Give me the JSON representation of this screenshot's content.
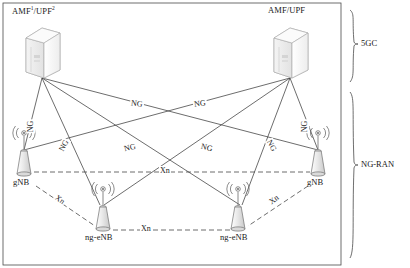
{
  "figure": {
    "type": "network-architecture-diagram",
    "title": "",
    "background": "#ffffff",
    "line_color": "#3c3c3c",
    "node_fill": "#eeeeee"
  },
  "nodes": [
    {
      "id": "amf-upf-left",
      "label": "AMF/UPF",
      "sup1": "1",
      "sup2": "2",
      "has_superscripts": true,
      "icon": "server-box-icon",
      "x": 42,
      "y": 48,
      "label_x": 12,
      "label_y": 6
    },
    {
      "id": "amf-upf-right",
      "label": "AMF/UPF",
      "sup1": "",
      "sup2": "",
      "has_superscripts": false,
      "icon": "server-box-icon",
      "x": 290,
      "y": 48,
      "label_x": 268,
      "label_y": 6
    },
    {
      "id": "gnb-left",
      "label": "gNB",
      "icon": "base-station-icon",
      "x": 24,
      "y": 158,
      "label_x": 13,
      "label_y": 178
    },
    {
      "id": "gnb-right",
      "label": "gNB",
      "icon": "base-station-icon",
      "x": 318,
      "y": 158,
      "label_x": 307,
      "label_y": 178
    },
    {
      "id": "ng-enb-left",
      "label": "ng-eNB",
      "icon": "base-station-icon",
      "x": 103,
      "y": 212,
      "label_x": 84,
      "label_y": 234
    },
    {
      "id": "ng-enb-right",
      "label": "ng-eNB",
      "icon": "base-station-icon",
      "x": 238,
      "y": 212,
      "label_x": 219,
      "label_y": 234
    }
  ],
  "ng_links": [
    {
      "id": "ng-1",
      "from": "amf-upf-left",
      "to": "gnb-left",
      "label": "NG",
      "label_x": 29,
      "label_y": 128,
      "rotate": -90
    },
    {
      "id": "ng-2",
      "from": "amf-upf-left",
      "to": "ng-enb-left",
      "label": "NG",
      "label_x": 62,
      "label_y": 146,
      "rotate": -60
    },
    {
      "id": "ng-3",
      "from": "amf-upf-left",
      "to": "ng-enb-right",
      "label": "NG",
      "label_x": 136,
      "label_y": 104,
      "rotate": 0
    },
    {
      "id": "ng-4",
      "from": "amf-upf-left",
      "to": "gnb-right",
      "label": "NG",
      "label_x": 205,
      "label_y": 148,
      "rotate": 0
    },
    {
      "id": "ng-5",
      "from": "amf-upf-right",
      "to": "gnb-right",
      "label": "NG",
      "label_x": 303,
      "label_y": 128,
      "rotate": -90
    },
    {
      "id": "ng-6",
      "from": "amf-upf-right",
      "to": "ng-enb-right",
      "label": "NG",
      "label_x": 270,
      "label_y": 146,
      "rotate": 60
    },
    {
      "id": "ng-7",
      "from": "amf-upf-right",
      "to": "ng-enb-left",
      "label": "NG",
      "label_x": 198,
      "label_y": 104,
      "rotate": 0
    },
    {
      "id": "ng-8",
      "from": "amf-upf-right",
      "to": "gnb-left",
      "label": "NG",
      "label_x": 128,
      "label_y": 148,
      "rotate": 0
    }
  ],
  "xn_links": [
    {
      "id": "xn-center",
      "label": "Xn",
      "label_x": 163,
      "label_y": 166,
      "rotate": 0
    },
    {
      "id": "xn-bottom",
      "label": "Xn",
      "label_x": 144,
      "label_y": 229,
      "rotate": 0
    },
    {
      "id": "xn-left-diag",
      "label": "Xn",
      "label_x": 58,
      "label_y": 198,
      "rotate": 38
    },
    {
      "id": "xn-right-diag",
      "label": "Xn",
      "label_x": 272,
      "label_y": 198,
      "rotate": -38
    }
  ],
  "groups": [
    {
      "id": "group-5gc",
      "label": "5GC",
      "label_x": 362,
      "label_y": 38,
      "brace_top": 10,
      "brace_bottom": 82
    },
    {
      "id": "group-ng-ran",
      "label": "NG-RAN",
      "label_x": 362,
      "label_y": 158,
      "brace_top": 92,
      "brace_bottom": 258
    }
  ],
  "border": {
    "visible": true,
    "color": "#3c3c3c"
  }
}
